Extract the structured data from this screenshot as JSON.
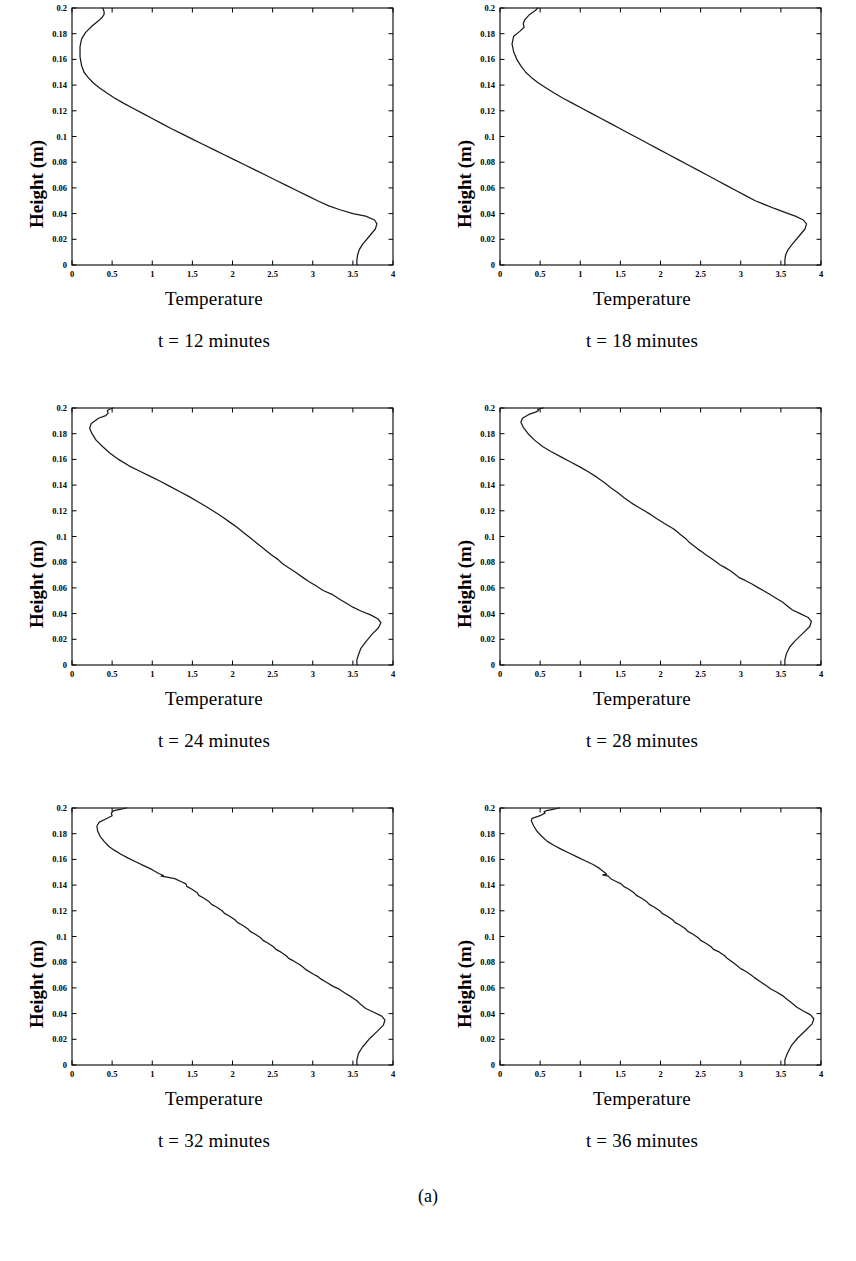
{
  "figure": {
    "caption": "(a)",
    "panel_count": 6
  },
  "axes": {
    "xlabel": "Temperature",
    "ylabel": "Height (m)",
    "xticks": [
      "0",
      "0.5",
      "1",
      "1.5",
      "2",
      "2.5",
      "3",
      "3.5",
      "4"
    ],
    "xtick_values": [
      0,
      0.5,
      1,
      1.5,
      2,
      2.5,
      3,
      3.5,
      4
    ],
    "yticks": [
      "0",
      "0.02",
      "0.04",
      "0.06",
      "0.08",
      "0.1",
      "0.12",
      "0.14",
      "0.16",
      "0.18",
      "0.2"
    ],
    "ytick_values": [
      0,
      0.02,
      0.04,
      0.06,
      0.08,
      0.1,
      0.12,
      0.14,
      0.16,
      0.18,
      0.2
    ],
    "xlim": [
      0,
      4
    ],
    "ylim": [
      0,
      0.2
    ]
  },
  "panels": [
    {
      "id": "t12",
      "title": "t = 12 minutes",
      "xlabel": "Temperature",
      "ylabel": "Height (m)"
    },
    {
      "id": "t18",
      "title": "t = 18 minutes",
      "xlabel": "Temperature",
      "ylabel": "Height (m)"
    },
    {
      "id": "t24",
      "title": "t = 24 minutes",
      "xlabel": "Temperature",
      "ylabel": "Height (m)"
    },
    {
      "id": "t28",
      "title": "t = 28 minutes",
      "xlabel": "Temperature",
      "ylabel": "Height (m)"
    },
    {
      "id": "t32",
      "title": "t = 32 minutes",
      "xlabel": "Temperature",
      "ylabel": "Height (m)"
    },
    {
      "id": "t36",
      "title": "t = 36 minutes",
      "xlabel": "Temperature",
      "ylabel": "Height (m)"
    }
  ],
  "chart_data": [
    {
      "type": "line",
      "title": "t = 12 minutes",
      "xlabel": "Temperature",
      "ylabel": "Height (m)",
      "xlim": [
        0,
        4
      ],
      "ylim": [
        0,
        0.2
      ],
      "grid": false,
      "legend": null,
      "series": [
        {
          "name": "temperature profile",
          "x": [
            3.55,
            3.55,
            3.56,
            3.58,
            3.62,
            3.7,
            3.78,
            3.8,
            3.77,
            3.66,
            3.5,
            3.34,
            3.2,
            3.06,
            2.93,
            2.8,
            2.67,
            2.54,
            2.41,
            2.28,
            2.15,
            2.02,
            1.89,
            1.76,
            1.63,
            1.5,
            1.37,
            1.24,
            1.12,
            1.0,
            0.88,
            0.76,
            0.64,
            0.53,
            0.43,
            0.34,
            0.26,
            0.2,
            0.15,
            0.12,
            0.1,
            0.1,
            0.12,
            0.17,
            0.25,
            0.33,
            0.38,
            0.4,
            0.4,
            0.39,
            0.38
          ],
          "y": [
            0.0,
            0.004,
            0.008,
            0.012,
            0.016,
            0.022,
            0.028,
            0.032,
            0.035,
            0.038,
            0.04,
            0.043,
            0.046,
            0.05,
            0.054,
            0.058,
            0.062,
            0.066,
            0.07,
            0.074,
            0.078,
            0.082,
            0.086,
            0.09,
            0.094,
            0.098,
            0.102,
            0.106,
            0.11,
            0.114,
            0.118,
            0.122,
            0.126,
            0.13,
            0.134,
            0.138,
            0.142,
            0.146,
            0.15,
            0.155,
            0.162,
            0.17,
            0.176,
            0.181,
            0.186,
            0.19,
            0.193,
            0.195,
            0.197,
            0.199,
            0.2
          ]
        }
      ]
    },
    {
      "type": "line",
      "title": "t = 18 minutes",
      "xlabel": "Temperature",
      "ylabel": "Height (m)",
      "xlim": [
        0,
        4
      ],
      "ylim": [
        0,
        0.2
      ],
      "grid": false,
      "legend": null,
      "series": [
        {
          "name": "temperature profile",
          "x": [
            3.55,
            3.55,
            3.56,
            3.59,
            3.64,
            3.72,
            3.8,
            3.82,
            3.78,
            3.68,
            3.55,
            3.42,
            3.3,
            3.18,
            3.06,
            2.94,
            2.82,
            2.7,
            2.58,
            2.46,
            2.34,
            2.22,
            2.1,
            1.98,
            1.86,
            1.74,
            1.62,
            1.5,
            1.38,
            1.26,
            1.14,
            1.02,
            0.9,
            0.78,
            0.67,
            0.57,
            0.47,
            0.39,
            0.32,
            0.26,
            0.21,
            0.17,
            0.15,
            0.17,
            0.25,
            0.3,
            0.29,
            0.31,
            0.37,
            0.44,
            0.47
          ],
          "y": [
            0.0,
            0.004,
            0.008,
            0.012,
            0.016,
            0.022,
            0.028,
            0.032,
            0.035,
            0.038,
            0.041,
            0.044,
            0.047,
            0.05,
            0.054,
            0.058,
            0.062,
            0.066,
            0.07,
            0.074,
            0.078,
            0.082,
            0.086,
            0.09,
            0.094,
            0.098,
            0.102,
            0.106,
            0.11,
            0.114,
            0.118,
            0.122,
            0.126,
            0.13,
            0.134,
            0.138,
            0.142,
            0.146,
            0.15,
            0.155,
            0.16,
            0.166,
            0.172,
            0.178,
            0.182,
            0.185,
            0.188,
            0.191,
            0.195,
            0.198,
            0.2
          ]
        }
      ]
    },
    {
      "type": "line",
      "title": "t = 24 minutes",
      "xlabel": "Temperature",
      "ylabel": "Height (m)",
      "xlim": [
        0,
        4
      ],
      "ylim": [
        0,
        0.2
      ],
      "grid": false,
      "legend": null,
      "series": [
        {
          "name": "temperature profile",
          "x": [
            3.55,
            3.55,
            3.57,
            3.6,
            3.66,
            3.74,
            3.82,
            3.85,
            3.81,
            3.72,
            3.6,
            3.5,
            3.42,
            3.34,
            3.24,
            3.13,
            3.03,
            2.95,
            2.88,
            2.79,
            2.69,
            2.62,
            2.57,
            2.5,
            2.42,
            2.36,
            2.3,
            2.22,
            2.14,
            2.06,
            1.97,
            1.88,
            1.78,
            1.68,
            1.57,
            1.46,
            1.34,
            1.22,
            1.1,
            0.97,
            0.84,
            0.71,
            0.58,
            0.47,
            0.38,
            0.3,
            0.25,
            0.22,
            0.24,
            0.33,
            0.42,
            0.45,
            0.44,
            0.47,
            0.51
          ],
          "y": [
            0.0,
            0.004,
            0.008,
            0.013,
            0.018,
            0.024,
            0.029,
            0.033,
            0.036,
            0.039,
            0.042,
            0.045,
            0.048,
            0.051,
            0.055,
            0.058,
            0.062,
            0.065,
            0.068,
            0.072,
            0.076,
            0.079,
            0.082,
            0.085,
            0.089,
            0.092,
            0.095,
            0.099,
            0.103,
            0.107,
            0.111,
            0.115,
            0.119,
            0.123,
            0.127,
            0.131,
            0.135,
            0.139,
            0.143,
            0.147,
            0.151,
            0.155,
            0.16,
            0.165,
            0.17,
            0.175,
            0.18,
            0.184,
            0.188,
            0.192,
            0.194,
            0.196,
            0.198,
            0.199,
            0.2
          ]
        }
      ]
    },
    {
      "type": "line",
      "title": "t = 28 minutes",
      "xlabel": "Temperature",
      "ylabel": "Height (m)",
      "xlim": [
        0,
        4
      ],
      "ylim": [
        0,
        0.2
      ],
      "grid": false,
      "legend": null,
      "series": [
        {
          "name": "temperature profile",
          "x": [
            3.55,
            3.55,
            3.57,
            3.61,
            3.68,
            3.78,
            3.86,
            3.88,
            3.84,
            3.74,
            3.64,
            3.58,
            3.52,
            3.44,
            3.36,
            3.28,
            3.22,
            3.14,
            3.05,
            2.98,
            2.94,
            2.88,
            2.8,
            2.74,
            2.7,
            2.63,
            2.56,
            2.52,
            2.47,
            2.41,
            2.35,
            2.32,
            2.26,
            2.2,
            2.16,
            2.08,
            2.0,
            1.95,
            1.88,
            1.8,
            1.72,
            1.64,
            1.55,
            1.47,
            1.38,
            1.3,
            1.21,
            1.11,
            1.0,
            0.88,
            0.76,
            0.64,
            0.53,
            0.43,
            0.35,
            0.29,
            0.26,
            0.28,
            0.36,
            0.45,
            0.48,
            0.47,
            0.5,
            0.54
          ],
          "y": [
            0.0,
            0.004,
            0.009,
            0.014,
            0.019,
            0.025,
            0.03,
            0.034,
            0.037,
            0.04,
            0.043,
            0.046,
            0.049,
            0.052,
            0.055,
            0.058,
            0.06,
            0.063,
            0.066,
            0.068,
            0.07,
            0.073,
            0.076,
            0.078,
            0.08,
            0.083,
            0.086,
            0.088,
            0.09,
            0.093,
            0.096,
            0.098,
            0.101,
            0.104,
            0.106,
            0.109,
            0.112,
            0.114,
            0.117,
            0.12,
            0.123,
            0.126,
            0.13,
            0.134,
            0.138,
            0.142,
            0.146,
            0.15,
            0.154,
            0.158,
            0.162,
            0.166,
            0.17,
            0.175,
            0.18,
            0.185,
            0.189,
            0.192,
            0.195,
            0.197,
            0.198,
            0.199,
            0.1995,
            0.2
          ]
        }
      ]
    },
    {
      "type": "line",
      "title": "t = 32 minutes",
      "xlabel": "Temperature",
      "ylabel": "Height (m)",
      "xlim": [
        0,
        4
      ],
      "ylim": [
        0,
        0.2
      ],
      "grid": false,
      "legend": null,
      "series": [
        {
          "name": "temperature profile",
          "x": [
            3.55,
            3.55,
            3.57,
            3.62,
            3.7,
            3.8,
            3.88,
            3.9,
            3.86,
            3.76,
            3.66,
            3.6,
            3.55,
            3.48,
            3.4,
            3.33,
            3.26,
            3.18,
            3.1,
            3.06,
            3.0,
            2.92,
            2.88,
            2.84,
            2.76,
            2.7,
            2.67,
            2.6,
            2.54,
            2.51,
            2.44,
            2.38,
            2.35,
            2.28,
            2.22,
            2.19,
            2.12,
            2.06,
            2.03,
            1.96,
            1.9,
            1.87,
            1.8,
            1.74,
            1.71,
            1.64,
            1.58,
            1.56,
            1.49,
            1.43,
            1.42,
            1.35,
            1.28,
            1.2,
            1.11,
            1.14,
            1.08,
            1.0,
            0.9,
            0.8,
            0.7,
            0.61,
            0.53,
            0.46,
            0.4,
            0.35,
            0.32,
            0.31,
            0.34,
            0.44,
            0.5,
            0.49,
            0.52,
            0.6,
            0.68
          ],
          "y": [
            0.0,
            0.004,
            0.009,
            0.014,
            0.02,
            0.026,
            0.031,
            0.035,
            0.038,
            0.041,
            0.044,
            0.047,
            0.05,
            0.053,
            0.056,
            0.059,
            0.061,
            0.064,
            0.067,
            0.069,
            0.071,
            0.074,
            0.076,
            0.078,
            0.081,
            0.083,
            0.085,
            0.088,
            0.09,
            0.092,
            0.095,
            0.097,
            0.099,
            0.102,
            0.104,
            0.106,
            0.109,
            0.111,
            0.113,
            0.116,
            0.118,
            0.12,
            0.123,
            0.125,
            0.127,
            0.13,
            0.132,
            0.134,
            0.137,
            0.139,
            0.141,
            0.143,
            0.145,
            0.146,
            0.147,
            0.1475,
            0.149,
            0.152,
            0.155,
            0.158,
            0.161,
            0.164,
            0.167,
            0.17,
            0.174,
            0.178,
            0.182,
            0.186,
            0.189,
            0.192,
            0.194,
            0.196,
            0.198,
            0.199,
            0.2
          ]
        }
      ]
    },
    {
      "type": "line",
      "title": "t = 36 minutes",
      "xlabel": "Temperature",
      "ylabel": "Height (m)",
      "xlim": [
        0,
        4
      ],
      "ylim": [
        0,
        0.2
      ],
      "grid": false,
      "legend": null,
      "series": [
        {
          "name": "temperature profile",
          "x": [
            3.55,
            3.55,
            3.58,
            3.63,
            3.71,
            3.81,
            3.89,
            3.91,
            3.87,
            3.78,
            3.7,
            3.64,
            3.58,
            3.52,
            3.44,
            3.38,
            3.31,
            3.24,
            3.17,
            3.13,
            3.06,
            3.0,
            2.96,
            2.9,
            2.83,
            2.8,
            2.73,
            2.66,
            2.63,
            2.56,
            2.5,
            2.47,
            2.4,
            2.34,
            2.31,
            2.24,
            2.18,
            2.15,
            2.08,
            2.02,
            1.99,
            1.92,
            1.86,
            1.83,
            1.76,
            1.7,
            1.67,
            1.6,
            1.54,
            1.51,
            1.44,
            1.38,
            1.35,
            1.28,
            1.33,
            1.3,
            1.24,
            1.16,
            1.06,
            0.96,
            0.86,
            0.76,
            0.67,
            0.59,
            0.52,
            0.46,
            0.42,
            0.39,
            0.4,
            0.5,
            0.56,
            0.55,
            0.58,
            0.66,
            0.74
          ],
          "y": [
            0.0,
            0.004,
            0.009,
            0.015,
            0.021,
            0.027,
            0.032,
            0.036,
            0.039,
            0.042,
            0.045,
            0.048,
            0.051,
            0.054,
            0.057,
            0.059,
            0.062,
            0.065,
            0.068,
            0.07,
            0.073,
            0.075,
            0.077,
            0.08,
            0.083,
            0.085,
            0.088,
            0.09,
            0.092,
            0.095,
            0.097,
            0.099,
            0.102,
            0.104,
            0.106,
            0.109,
            0.111,
            0.113,
            0.116,
            0.118,
            0.12,
            0.123,
            0.125,
            0.127,
            0.13,
            0.132,
            0.134,
            0.137,
            0.139,
            0.141,
            0.143,
            0.145,
            0.147,
            0.148,
            0.1485,
            0.15,
            0.153,
            0.156,
            0.159,
            0.162,
            0.165,
            0.168,
            0.171,
            0.174,
            0.178,
            0.182,
            0.186,
            0.19,
            0.192,
            0.194,
            0.196,
            0.197,
            0.198,
            0.199,
            0.2
          ]
        }
      ]
    }
  ]
}
